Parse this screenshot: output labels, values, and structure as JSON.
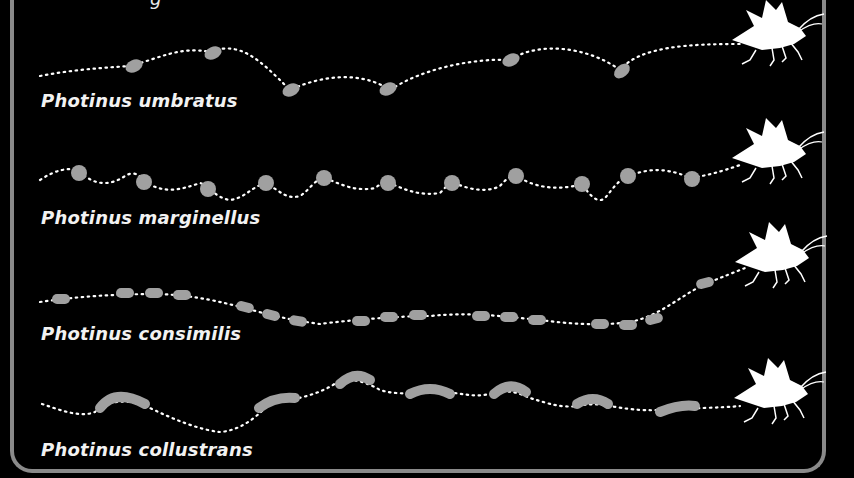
{
  "figure": {
    "title_fragment": "g",
    "colors": {
      "background": "#000000",
      "border": "#8a8a8a",
      "flash": "#a0a0a0",
      "path_dots": "#ffffff",
      "firefly": "#ffffff",
      "label": "#f2f2f2"
    },
    "rows": [
      {
        "species": "Photinus umbratus",
        "flash_shape": "bean",
        "flash_count": 6
      },
      {
        "species": "Photinus marginellus",
        "flash_shape": "dot",
        "flash_count": 11
      },
      {
        "species": "Photinus consimilis",
        "flash_shape": "short-dash",
        "flash_count": 15
      },
      {
        "species": "Photinus collustrans",
        "flash_shape": "long-arc",
        "flash_count": 8
      }
    ],
    "icons": [
      "firefly-silhouette-icon"
    ]
  }
}
